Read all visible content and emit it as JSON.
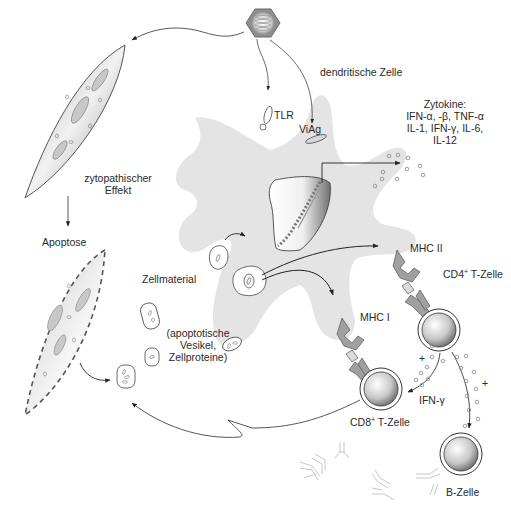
{
  "diagram": {
    "title": "",
    "labels": {
      "dendritic_cell": "dendritische Zelle",
      "tlr": "TLR",
      "viag": "ViAg",
      "cytokines_heading": "Zytokine:",
      "cytokines_line1": "IFN-α, -β, TNF-α",
      "cytokines_line2": "IL-1, IFN-γ, IL-6,",
      "cytokines_line3": "IL-12",
      "cytopathic_line1": "zytopathischer",
      "cytopathic_line2": "Effekt",
      "apoptosis": "Apoptose",
      "cell_material": "Zellmaterial",
      "vesicles_line1": "(apoptotische",
      "vesicles_line2": "Vesikel,",
      "vesicles_line3": "Zellproteine)",
      "mhc2": "MHC II",
      "mhc1": "MHC I",
      "cd4_prefix": "CD4",
      "cd4_sup": "+",
      "cd4_suffix": " T-Zelle",
      "cd8_prefix": "CD8",
      "cd8_sup": "+",
      "cd8_suffix": " T-Zelle",
      "ifn_gamma": "IFN-γ",
      "b_cell": "B-Zelle",
      "plus_1": "+",
      "plus_2": "+"
    },
    "nodes": [
      {
        "id": "virus",
        "label": "Virus (hexagonal capsid)"
      },
      {
        "id": "infected-cell",
        "label": "zytopathischer Effekt"
      },
      {
        "id": "apoptotic-cell",
        "label": "Apoptose"
      },
      {
        "id": "dendritic-cell",
        "label": "dendritische Zelle"
      },
      {
        "id": "cd4-t-cell",
        "label": "CD4+ T-Zelle"
      },
      {
        "id": "cd8-t-cell",
        "label": "CD8+ T-Zelle"
      },
      {
        "id": "b-cell",
        "label": "B-Zelle"
      }
    ],
    "colors": {
      "dc_fill": "#e4e4e4",
      "cell_gradient_light": "#f4f4f4",
      "cell_gradient_dark": "#8e8e8e",
      "stroke": "#333333",
      "receptor": "#9a9a9a"
    }
  }
}
